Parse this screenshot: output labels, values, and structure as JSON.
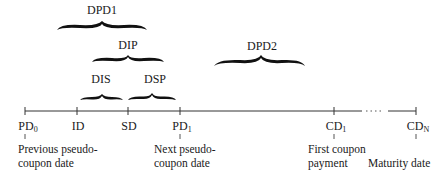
{
  "diagram": {
    "timeline": {
      "ticks": [
        {
          "label": "PD",
          "sub": "0"
        },
        {
          "label": "ID",
          "sub": ""
        },
        {
          "label": "SD",
          "sub": ""
        },
        {
          "label": "PD",
          "sub": "1"
        },
        {
          "label": "CD",
          "sub": "1"
        },
        {
          "label": "CD",
          "sub": "N"
        }
      ],
      "ellipsis": "· · · · ·"
    },
    "intervals": {
      "dpd1": "DPD1",
      "dip": "DIP",
      "dis": "DIS",
      "dsp": "DSP",
      "dpd2": "DPD2"
    },
    "descriptions": {
      "pd0": [
        "Previous pseudo-",
        "coupon date"
      ],
      "pd1": [
        "Next pseudo-",
        "coupon date"
      ],
      "cd1": [
        "First coupon",
        "payment"
      ],
      "cdn": [
        "Maturity date"
      ]
    }
  }
}
